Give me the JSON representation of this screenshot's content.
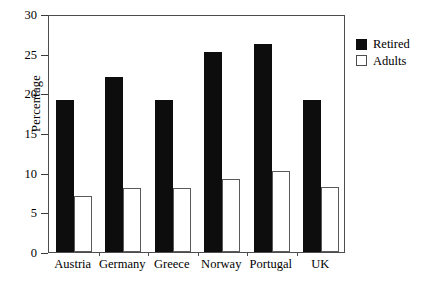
{
  "chart_data": {
    "type": "bar",
    "title": "",
    "xlabel": "",
    "ylabel": "Percentage",
    "categories": [
      "Austria",
      "Germany",
      "Greece",
      "Norway",
      "Portugal",
      "UK"
    ],
    "series": [
      {
        "name": "Retired",
        "values": [
          19.1,
          22.0,
          19.2,
          25.2,
          26.2,
          19.2
        ],
        "color": "#0d0d0d",
        "fill": "solid"
      },
      {
        "name": "Adults",
        "values": [
          7.0,
          8.1,
          8.1,
          9.2,
          10.2,
          8.2
        ],
        "color": "#ffffff",
        "fill": "outline"
      }
    ],
    "ylim": [
      0,
      30
    ],
    "ytick_values": [
      0,
      5,
      10,
      15,
      20,
      25,
      30
    ],
    "ytick_labels": [
      "0",
      "5",
      "10",
      "15",
      "20",
      "25",
      "30"
    ],
    "grid": false,
    "legend_position": "right-outside",
    "frame": "box",
    "bar_style": "grouped-adjacent"
  },
  "axes": {
    "y_title": "Percentage",
    "y_ticks": [
      {
        "label": "30",
        "value": 30
      },
      {
        "label": "25",
        "value": 25
      },
      {
        "label": "20",
        "value": 20
      },
      {
        "label": "15",
        "value": 15
      },
      {
        "label": "10",
        "value": 10
      },
      {
        "label": "5",
        "value": 5
      },
      {
        "label": "0",
        "value": 0
      }
    ],
    "x_categories": [
      "Austria",
      "Germany",
      "Greece",
      "Norway",
      "Portugal",
      "UK"
    ]
  },
  "legend": {
    "items": [
      {
        "label": "Retired",
        "swatch": "filled-square"
      },
      {
        "label": "Adults",
        "swatch": "outlined-square"
      }
    ]
  }
}
